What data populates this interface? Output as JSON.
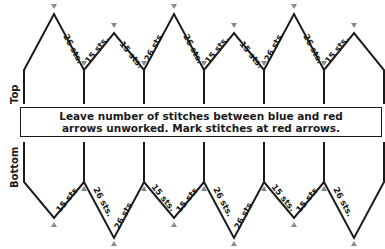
{
  "diagram": {
    "type": "knitting-schematic",
    "sections": {
      "top_label": "Top",
      "bottom_label": "Bottom"
    },
    "note": {
      "line1": "Leave number of stitches between blue and red",
      "line2": "arrows unworked. Mark stitches at red arrows."
    },
    "arrow_colors": {
      "blue": "#6a7fb5",
      "red": "#c0504d"
    },
    "top_edge_labels": [
      {
        "text": "26 sts.",
        "segment": "peak1-down"
      },
      {
        "text": "15 sts.",
        "segment": "valley1-up"
      },
      {
        "text": "15 sts.",
        "segment": "peak2-down"
      },
      {
        "text": "26 sts.",
        "segment": "valley2-up"
      },
      {
        "text": "26 sts.",
        "segment": "peak3-down"
      },
      {
        "text": "15 sts.",
        "segment": "valley3-up"
      },
      {
        "text": "15 sts.",
        "segment": "peak4-down"
      },
      {
        "text": "26 sts.",
        "segment": "valley4-up"
      },
      {
        "text": "26 sts.",
        "segment": "peak5-down"
      },
      {
        "text": "15 sts.",
        "segment": "valley5-up"
      }
    ],
    "bottom_edge_labels": [
      {
        "text": "15 sts.",
        "segment": "valley1-up"
      },
      {
        "text": "26 sts.",
        "segment": "peak1-down"
      },
      {
        "text": "26 sts.",
        "segment": "valley2-up"
      },
      {
        "text": "15 sts.",
        "segment": "peak2-down"
      },
      {
        "text": "15 sts.",
        "segment": "valley3-up"
      },
      {
        "text": "26 sts.",
        "segment": "peak3-down"
      },
      {
        "text": "26 sts.",
        "segment": "valley4-up"
      },
      {
        "text": "15 sts.",
        "segment": "peak4-down"
      },
      {
        "text": "15 sts.",
        "segment": "valley5-up"
      },
      {
        "text": "26 sts.",
        "segment": "peak5-down"
      }
    ]
  }
}
